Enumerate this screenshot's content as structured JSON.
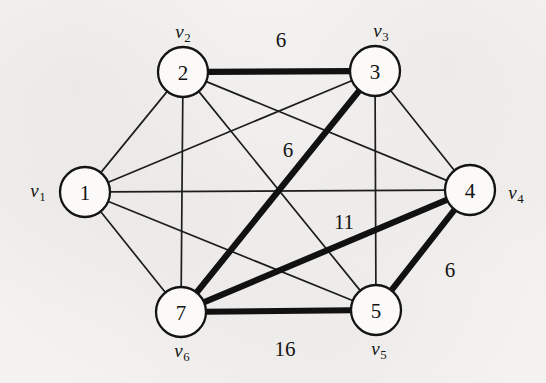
{
  "figure": {
    "type": "weighted-graph-diagram",
    "title": "",
    "background_color": "#f3f2f0",
    "ink_color": "#141414"
  },
  "nodes": [
    {
      "id": "n1",
      "label": "1",
      "vertex_name": "v",
      "vertex_sub": "1",
      "cx": 85,
      "cy": 192,
      "r": 25,
      "name_x": 38,
      "name_y": 192
    },
    {
      "id": "n2",
      "label": "2",
      "vertex_name": "v",
      "vertex_sub": "2",
      "cx": 183,
      "cy": 72,
      "r": 25,
      "name_x": 183,
      "name_y": 33
    },
    {
      "id": "n3",
      "label": "3",
      "vertex_name": "v",
      "vertex_sub": "3",
      "cx": 375,
      "cy": 71,
      "r": 25,
      "name_x": 381,
      "name_y": 32
    },
    {
      "id": "n4",
      "label": "4",
      "vertex_name": "v",
      "vertex_sub": "4",
      "cx": 470,
      "cy": 190,
      "r": 25,
      "name_x": 516,
      "name_y": 194
    },
    {
      "id": "n5",
      "label": "5",
      "vertex_name": "v",
      "vertex_sub": "5",
      "cx": 376,
      "cy": 310,
      "r": 25,
      "name_x": 379,
      "name_y": 350
    },
    {
      "id": "n7",
      "label": "7",
      "vertex_name": "v",
      "vertex_sub": "6",
      "cx": 181,
      "cy": 312,
      "r": 25,
      "name_x": 182,
      "name_y": 352
    }
  ],
  "edges": [
    {
      "from": "n2",
      "to": "n3",
      "weight": "6",
      "style": "bold"
    },
    {
      "from": "n3",
      "to": "n7",
      "weight": "6",
      "style": "bold"
    },
    {
      "from": "n7",
      "to": "n4",
      "weight": "11",
      "style": "bold"
    },
    {
      "from": "n4",
      "to": "n5",
      "weight": "6",
      "style": "bold"
    },
    {
      "from": "n7",
      "to": "n5",
      "weight": "16",
      "style": "bold"
    },
    {
      "from": "n1",
      "to": "n2",
      "weight": "",
      "style": "thin"
    },
    {
      "from": "n1",
      "to": "n3",
      "weight": "",
      "style": "thin"
    },
    {
      "from": "n1",
      "to": "n4",
      "weight": "",
      "style": "thin"
    },
    {
      "from": "n1",
      "to": "n5",
      "weight": "",
      "style": "thin"
    },
    {
      "from": "n1",
      "to": "n7",
      "weight": "",
      "style": "thin"
    },
    {
      "from": "n2",
      "to": "n4",
      "weight": "",
      "style": "thin"
    },
    {
      "from": "n2",
      "to": "n5",
      "weight": "",
      "style": "thin"
    },
    {
      "from": "n2",
      "to": "n7",
      "weight": "",
      "style": "thin"
    },
    {
      "from": "n3",
      "to": "n4",
      "weight": "",
      "style": "thin"
    },
    {
      "from": "n3",
      "to": "n5",
      "weight": "",
      "style": "thin"
    }
  ],
  "weight_labels": [
    {
      "id": "w-2-3",
      "text": "6",
      "x": 281,
      "y": 40,
      "edge": "2-3"
    },
    {
      "id": "w-3-7",
      "text": "6",
      "x": 288,
      "y": 150,
      "edge": "3-7"
    },
    {
      "id": "w-7-4",
      "text": "11",
      "x": 344,
      "y": 222,
      "edge": "7-4"
    },
    {
      "id": "w-4-5",
      "text": "6",
      "x": 450,
      "y": 270,
      "edge": "4-5"
    },
    {
      "id": "w-7-5",
      "text": "16",
      "x": 285,
      "y": 349,
      "edge": "7-5"
    }
  ],
  "chart_data": {
    "type": "diagram",
    "subtype": "undirected weighted graph with highlighted spanning tree",
    "title": "",
    "vertices": [
      "v1",
      "v2",
      "v3",
      "v4",
      "v5",
      "v6"
    ],
    "vertex_display_numbers": [
      "1",
      "2",
      "3",
      "4",
      "5",
      "7"
    ],
    "highlighted_edges": [
      {
        "endpoints": [
          "2",
          "3"
        ],
        "weight": 6
      },
      {
        "endpoints": [
          "3",
          "7"
        ],
        "weight": 6
      },
      {
        "endpoints": [
          "7",
          "4"
        ],
        "weight": 11
      },
      {
        "endpoints": [
          "4",
          "5"
        ],
        "weight": 6
      },
      {
        "endpoints": [
          "7",
          "5"
        ],
        "weight": 16
      }
    ],
    "plain_edges": [
      [
        "1",
        "2"
      ],
      [
        "1",
        "3"
      ],
      [
        "1",
        "4"
      ],
      [
        "1",
        "5"
      ],
      [
        "1",
        "7"
      ],
      [
        "2",
        "4"
      ],
      [
        "2",
        "5"
      ],
      [
        "2",
        "7"
      ],
      [
        "3",
        "4"
      ],
      [
        "3",
        "5"
      ]
    ],
    "labeled_weights": [
      6,
      6,
      11,
      6,
      16
    ],
    "total_highlighted_weight": 45
  }
}
